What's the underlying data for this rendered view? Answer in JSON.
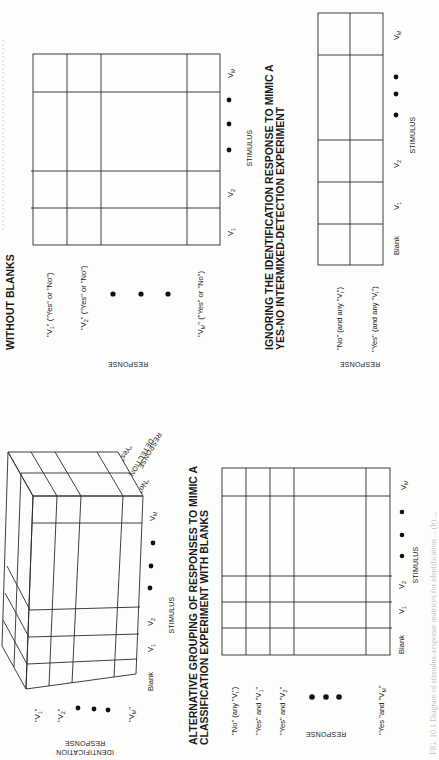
{
  "figure": {
    "orientation": "page rotated 90 degrees counter-clockwise",
    "caption_partial": "FIG. 10.1 Diagram of stimulus–response matrices for identification ... (b) ...",
    "panels": {
      "without_blanks": {
        "title": "WITHOUT BLANKS",
        "response_axis_label": "RESPONSE",
        "stimulus_axis_label": "STIMULUS",
        "row_labels": [
          {
            "text": "\"V",
            "sub": "1",
            "tail": "\" (\"Yes\" or \"No\")"
          },
          {
            "text": "\"V",
            "sub": "2",
            "tail": "\" (\"Yes\" or \"No\")"
          },
          {
            "text": "\"V",
            "sub": "M",
            "tail": "\" (\"Yes\" or \"No\")"
          }
        ],
        "column_labels": [
          {
            "text": "V",
            "sub": "1"
          },
          {
            "text": "V",
            "sub": "2"
          },
          {
            "text": "V",
            "sub": "M"
          }
        ],
        "ellipsis": "• • •"
      },
      "yes_no": {
        "title_line1": "IGNORING THE IDENTIFICATION RESPONSE TO MIMIC A",
        "title_line2": "YES-NO INTERMIXED-DETECTION EXPERIMENT",
        "response_axis_label": "RESPONSE",
        "stimulus_axis_label": "STIMULUS",
        "row_labels": [
          {
            "text": "\"No\" (and any \"V",
            "sub": "i",
            "tail": "\")"
          },
          {
            "text": "\"Yes\" (and any \"V",
            "sub": "i",
            "tail": "\")"
          }
        ],
        "column_labels": [
          {
            "text": "Blank",
            "sub": ""
          },
          {
            "text": "V",
            "sub": "1"
          },
          {
            "text": "V",
            "sub": "2"
          },
          {
            "text": "V",
            "sub": "M"
          }
        ],
        "ellipsis": "• • •"
      },
      "cube": {
        "identification_axis_label_line1": "IDENTIFICATION",
        "identification_axis_label_line2": "RESPONSE",
        "detection_axis_label_line1": "DETECTION",
        "detection_axis_label_line2": "RESPONSE",
        "detection_levels": [
          "\"No\"",
          "\"Yes\""
        ],
        "stimulus_axis_label": "STIMULUS",
        "identification_levels": [
          {
            "text": "\"V",
            "sub": "1",
            "tail": "\""
          },
          {
            "text": "\"V",
            "sub": "2",
            "tail": "\""
          },
          {
            "text": "\"V",
            "sub": "M",
            "tail": "\""
          }
        ],
        "column_labels": [
          {
            "text": "Blank",
            "sub": ""
          },
          {
            "text": "V",
            "sub": "1"
          },
          {
            "text": "V",
            "sub": "2"
          },
          {
            "text": "V",
            "sub": "M"
          }
        ]
      },
      "classification_with_blanks": {
        "title_line1": "ALTERNATIVE GROUPING OF RESPONSES TO MIMIC A",
        "title_line2": "CLASSIFICATION EXPERIMENT WITH BLANKS",
        "response_axis_label": "RESPONSE",
        "stimulus_axis_label": "STIMULUS",
        "row_labels": [
          {
            "text": "\"No\" (any \"V",
            "sub": "i",
            "tail": "\")"
          },
          {
            "text": "\"Yes\" and \"V",
            "sub": "1",
            "tail": "\""
          },
          {
            "text": "\"Yes\" and \"V",
            "sub": "2",
            "tail": "\""
          },
          {
            "text": "\"Yes \"and \"V",
            "sub": "M",
            "tail": "\""
          }
        ],
        "column_labels": [
          {
            "text": "Blank",
            "sub": ""
          },
          {
            "text": "V",
            "sub": "1"
          },
          {
            "text": "V",
            "sub": "2"
          },
          {
            "text": "V",
            "sub": "M"
          }
        ]
      }
    }
  }
}
